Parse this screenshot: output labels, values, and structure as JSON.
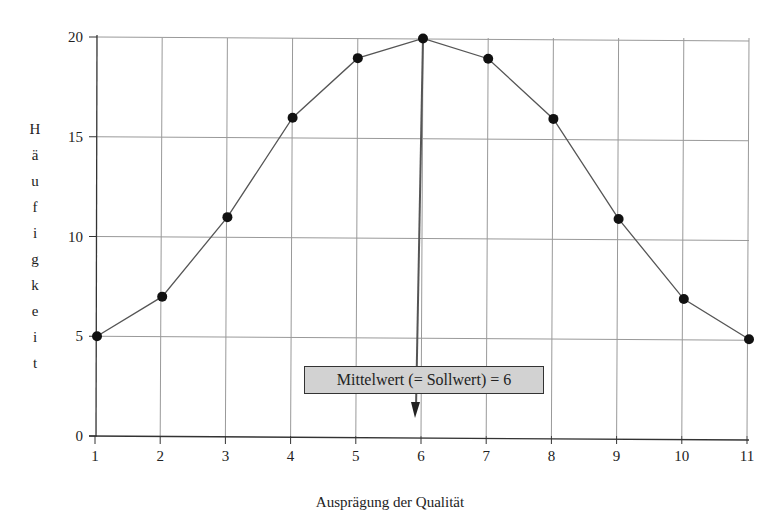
{
  "chart_data": {
    "type": "line",
    "title": "",
    "xlabel": "Ausprägung der Qualität",
    "ylabel": "Häufigkeit",
    "x": [
      1,
      2,
      3,
      4,
      5,
      6,
      7,
      8,
      9,
      10,
      11
    ],
    "values": [
      5,
      7,
      11,
      16,
      19,
      20,
      19,
      16,
      11,
      7,
      5
    ],
    "series": [
      {
        "name": "Häufigkeit",
        "values": [
          5,
          7,
          11,
          16,
          19,
          20,
          19,
          16,
          11,
          7,
          5
        ]
      }
    ],
    "xticks": [
      "1",
      "2",
      "3",
      "4",
      "5",
      "6",
      "7",
      "8",
      "9",
      "10",
      "11"
    ],
    "yticks": [
      "0",
      "5",
      "10",
      "15",
      "20"
    ],
    "ylim": [
      0,
      20
    ],
    "xlim": [
      1,
      11
    ],
    "grid": true,
    "legend": "none",
    "annotations": [
      {
        "text": "Mittelwert  (= Sollwert) = 6",
        "x": 6,
        "type": "arrow-box"
      }
    ],
    "colors": {
      "line": "#555555",
      "marker": "#111111",
      "grid": "#999999",
      "box_fill": "#d2d2d2"
    }
  },
  "labels": {
    "ylabel_letters": [
      "H",
      "ä",
      "u",
      "f",
      "i",
      "g",
      "k",
      "e",
      "i",
      "t"
    ],
    "xlabel": "Ausprägung der Qualität",
    "annotation": "Mittelwert  (= Sollwert) = 6"
  }
}
